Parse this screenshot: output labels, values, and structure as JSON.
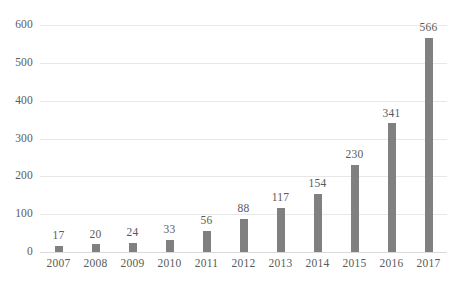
{
  "chart_data": {
    "type": "bar",
    "title": "",
    "subtitle": "",
    "xlabel": "",
    "ylabel": "",
    "categories": [
      "2007",
      "2008",
      "2009",
      "2010",
      "2011",
      "2012",
      "2013",
      "2014",
      "2015",
      "2016",
      "2017"
    ],
    "values": [
      17,
      20,
      24,
      33,
      56,
      88,
      117,
      154,
      230,
      341,
      566
    ],
    "data_labels": [
      "17",
      "20",
      "24",
      "33",
      "56",
      "88",
      "117",
      "154",
      "230",
      "341",
      "566"
    ],
    "ylim": [
      0,
      600
    ],
    "yticks": [
      0,
      100,
      200,
      300,
      400,
      500,
      600
    ],
    "ytick_labels": [
      "0",
      "100",
      "200",
      "300",
      "400",
      "500",
      "600"
    ],
    "grid": true,
    "grid_axis": "y",
    "legend": false,
    "legend_position": "none",
    "series": [
      {
        "name": "",
        "values": [
          17,
          20,
          24,
          33,
          56,
          88,
          117,
          154,
          230,
          341,
          566
        ]
      }
    ],
    "colors": {
      "bar": "#808080",
      "gridline": "#e8e8e8",
      "baseline": "#d9d9d9",
      "text": "#5a5a5a",
      "background": "#ffffff"
    }
  }
}
